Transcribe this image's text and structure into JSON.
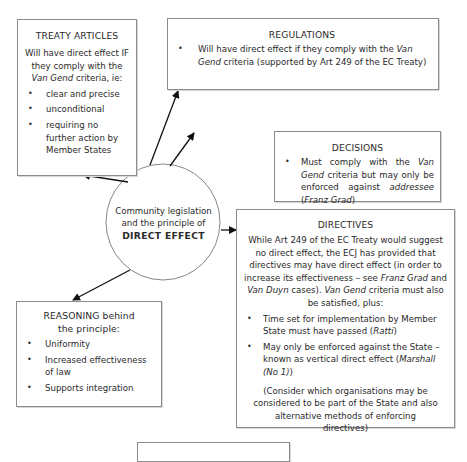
{
  "treaty_articles": {
    "title": "TREATY ARTICLES",
    "intro_1": "Will have direct effect IF they comply with the ",
    "intro_em": "Van Gend",
    "intro_2": " criteria, ie:",
    "bullets": [
      "clear and precise",
      "unconditional",
      "requiring no further action by Member States"
    ]
  },
  "regulations": {
    "title": "REGULATIONS",
    "bullet_1": "Will have direct effect if they comply with the ",
    "bullet_em": "Van Gend",
    "bullet_2": " criteria (supported by Art 249 of the EC Treaty)"
  },
  "decisions": {
    "title": "DECISIONS",
    "t1": "Must comply with the ",
    "em1": "Van Gend",
    "t2": " criteria but may only be enforced against ",
    "em2": "addressee",
    "t3": " (",
    "em3": "Franz Grad",
    "t4": ")"
  },
  "center": {
    "line_1": "Community legislation and the principle of ",
    "bold": "DIRECT EFFECT"
  },
  "directives": {
    "title": "DIRECTIVES",
    "p1": "While Art 249 of the EC Treaty would suggest no direct effect, the ECJ has provided that directives may have direct effect (in order to increase its effectiveness – see ",
    "p1_em1": "Franz Grad",
    "p1_and": " and ",
    "p1_em2": "Van Duyn",
    "p1_cases": " cases). ",
    "p1_em3": "Van Gend",
    "p1_end": " criteria must also be satisfied, plus:",
    "b1": "Time set for implementation by Member State must have passed (",
    "b1_em": "Ratti",
    "b1_end": ")",
    "b2": "May only be enforced against the State – known as vertical direct effect (",
    "b2_em": "Marshall (No 1)",
    "b2_end": ")",
    "note": "(Consider which organisations may be considered to be part of the State and also alternative methods of enforcing directives)"
  },
  "reasoning": {
    "title_1": "REASONING behind",
    "title_2": "the principle:",
    "bullets": [
      "Uniformity",
      "Increased effectiveness of law",
      "Supports integration"
    ]
  }
}
